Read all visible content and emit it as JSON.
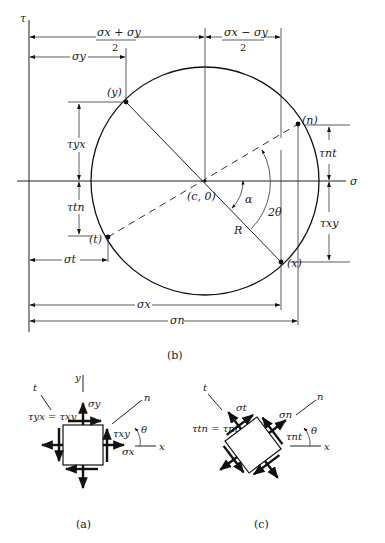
{
  "figure": {
    "panel_b": {
      "caption": "(b)",
      "axes": {
        "tau_label": "τ",
        "sigma_label": "σ"
      },
      "points": {
        "y": "(y)",
        "n": "(n)",
        "t": "(t)",
        "x": "(x)",
        "center": "(c, 0)"
      },
      "dimensions": {
        "mean_num": "σx + σy",
        "mean_den": "2",
        "half_diff_num": "σx − σy",
        "half_diff_den": "2",
        "sigma_y": "σy",
        "sigma_t": "σt",
        "sigma_x": "σx",
        "sigma_n": "σn",
        "tau_yx": "τyx",
        "tau_tn": "τtn",
        "tau_nt": "τnt",
        "tau_xy": "τxy"
      },
      "angles": {
        "alpha": "α",
        "two_theta": "2θ",
        "radius": "R"
      }
    },
    "panel_a": {
      "caption": "(a)",
      "axis_y": "y",
      "axis_x": "x",
      "axis_t": "t",
      "axis_n": "n",
      "equation": "τyx = τxy",
      "sigma_y": "σy",
      "sigma_x": "σx",
      "tau_xy": "τxy",
      "theta": "θ"
    },
    "panel_c": {
      "caption": "(c)",
      "axis_t": "t",
      "axis_n": "n",
      "axis_x": "x",
      "equation": "τtn = τnt",
      "sigma_t": "σt",
      "sigma_n": "σn",
      "tau_nt": "τnt",
      "theta": "θ"
    }
  }
}
